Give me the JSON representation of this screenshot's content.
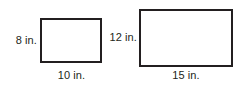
{
  "figure": {
    "unit": "in.",
    "stroke_color": "#231f20",
    "text_color": "#231f20",
    "background_color": "#ffffff",
    "shapes": [
      {
        "name": "small-rectangle",
        "height_label": "8 in.",
        "width_label": "10 in.",
        "height_value": 8,
        "width_value": 10
      },
      {
        "name": "large-rectangle",
        "height_label": "12 in.",
        "width_label": "15 in.",
        "height_value": 12,
        "width_value": 15
      }
    ]
  }
}
